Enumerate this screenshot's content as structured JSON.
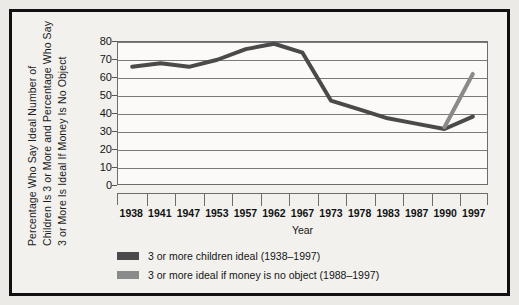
{
  "chart_data": {
    "type": "line",
    "title": "",
    "xlabel": "Year",
    "ylabel": "Percentage  Who Say Ideal Number of Children Is 3 or More and Percentage  Who Say 3 or More Is Ideal If Money Is No Object",
    "ylabel_lines": [
      "Percentage  Who Say Ideal Number of",
      "Children Is 3 or More and Percentage  Who Say",
      "3 or More Is Ideal If Money Is No Object"
    ],
    "categories": [
      "1938",
      "1941",
      "1947",
      "1953",
      "1957",
      "1962",
      "1967",
      "1973",
      "1978",
      "1983",
      "1987",
      "1990",
      "1997"
    ],
    "yticks": [
      0,
      10,
      20,
      30,
      40,
      50,
      60,
      70,
      80
    ],
    "ylim": [
      0,
      80
    ],
    "grid": true,
    "legend_position": "below-axis",
    "series": [
      {
        "name": "3 or more children ideal (1938–1997)",
        "color": "#4a4a4a",
        "x": [
          "1938",
          "1941",
          "1947",
          "1953",
          "1957",
          "1962",
          "1967",
          "1973",
          "1978",
          "1983",
          "1987",
          "1990",
          "1997"
        ],
        "values": [
          66,
          68,
          66,
          70,
          76,
          79,
          74,
          47,
          42,
          37,
          34,
          31,
          38
        ]
      },
      {
        "name": "3 or more ideal if money is no object (1988–1997)",
        "color": "#8a8a8a",
        "x": [
          "1990",
          "1997"
        ],
        "values": [
          32,
          62
        ]
      }
    ]
  },
  "legend": {
    "items": [
      {
        "label": "3 or more children ideal (1938–1997)",
        "color": "#4a4a4a"
      },
      {
        "label": "3 or more ideal if money is no object (1988–1997)",
        "color": "#8a8a8a"
      }
    ]
  },
  "axis": {
    "x_title": "Year"
  }
}
